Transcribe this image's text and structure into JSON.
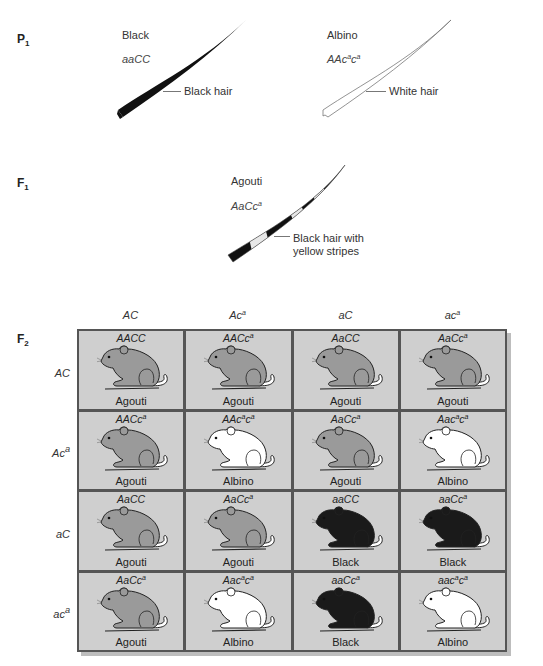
{
  "generations": {
    "p1": {
      "label": "P",
      "sub": "1"
    },
    "f1": {
      "label": "F",
      "sub": "1"
    },
    "f2": {
      "label": "F",
      "sub": "2"
    }
  },
  "p1": {
    "left": {
      "phenotype": "Black",
      "genotype_html": "aaCC",
      "hair_label": "Black hair",
      "hair_color": "#111111"
    },
    "right": {
      "phenotype": "Albino",
      "genotype_parts": [
        "AAc",
        "a",
        "c",
        "a"
      ],
      "hair_label": "White hair",
      "hair_color": "#ffffff"
    }
  },
  "f1": {
    "phenotype": "Agouti",
    "genotype_parts": [
      "AaCc",
      "a"
    ],
    "hair_label_line1": "Black hair with",
    "hair_label_line2": "yellow stripes"
  },
  "punnett": {
    "col_headers": [
      {
        "base": "AC",
        "sup": ""
      },
      {
        "base": "Ac",
        "sup": "a"
      },
      {
        "base": "aC",
        "sup": ""
      },
      {
        "base": "ac",
        "sup": "a"
      }
    ],
    "row_headers": [
      {
        "base": "AC",
        "sup": ""
      },
      {
        "base": "Ac",
        "sup": "a"
      },
      {
        "base": "aC",
        "sup": ""
      },
      {
        "base": "ac",
        "sup": "a"
      }
    ],
    "colors": {
      "agouti": "#9a9a9a",
      "albino": "#ffffff",
      "black": "#1a1a1a",
      "cell_bg": "#cfcfcf",
      "grid_line": "#555555"
    },
    "cells": [
      [
        {
          "genotype": "AACC",
          "sup_positions": [],
          "phenotype": "Agouti"
        },
        {
          "genotype": "AACc^a",
          "phenotype": "Agouti"
        },
        {
          "genotype": "AaCC",
          "phenotype": "Agouti"
        },
        {
          "genotype": "AaCc^a",
          "phenotype": "Agouti"
        }
      ],
      [
        {
          "genotype": "AACc^a",
          "phenotype": "Agouti"
        },
        {
          "genotype": "AAc^ac^a",
          "phenotype": "Albino"
        },
        {
          "genotype": "AaCc^a",
          "phenotype": "Agouti"
        },
        {
          "genotype": "Aac^ac^a",
          "phenotype": "Albino"
        }
      ],
      [
        {
          "genotype": "AaCC",
          "phenotype": "Agouti"
        },
        {
          "genotype": "AaCc^a",
          "phenotype": "Agouti"
        },
        {
          "genotype": "aaCC",
          "phenotype": "Black"
        },
        {
          "genotype": "aaCc^a",
          "phenotype": "Black"
        }
      ],
      [
        {
          "genotype": "AaCc^a",
          "phenotype": "Agouti"
        },
        {
          "genotype": "Aac^ac^a",
          "phenotype": "Albino"
        },
        {
          "genotype": "aaCc^a",
          "phenotype": "Black"
        },
        {
          "genotype": "aac^ac^a",
          "phenotype": "Albino"
        }
      ]
    ]
  }
}
